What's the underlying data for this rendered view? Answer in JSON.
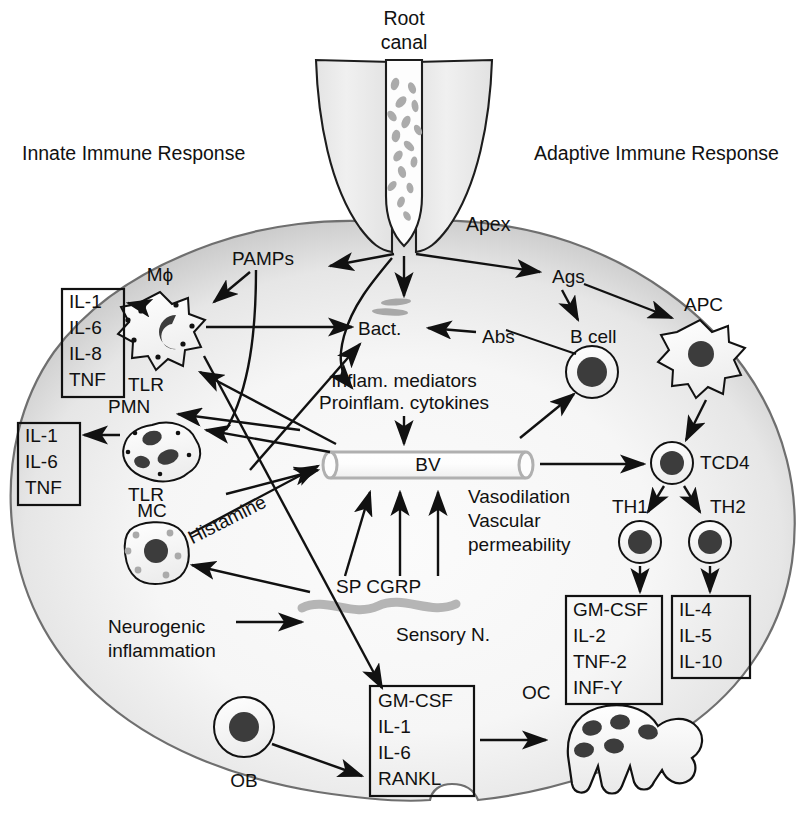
{
  "figure": {
    "headers": {
      "innate": "Innate Immune Response",
      "adaptive": "Adaptive Immune Response"
    },
    "anatomy": {
      "root_canal": "Root\ncanal",
      "root_canal_line1": "Root",
      "root_canal_line2": "canal",
      "apex": "Apex"
    },
    "nodes": {
      "pamps": "PAMPs",
      "mphi": "Mϕ",
      "tlr_mphi": "TLR",
      "pmn": "PMN",
      "tlr_pmn": "TLR",
      "mc": "MC",
      "histamine": "Histamine",
      "bact": "Bact.",
      "abs": "Abs",
      "ags": "Ags",
      "bcell": "B cell",
      "apc": "APC",
      "tcd4": "TCD4",
      "th1": "TH1",
      "th2": "TH2",
      "bv": "BV",
      "ob": "OB",
      "oc": "OC",
      "sp_cgrp": "SP CGRP",
      "sensory_n": "Sensory N.",
      "neurogenic_line1": "Neurogenic",
      "neurogenic_line2": "inflammation",
      "mediators_line1": "Inflam. mediators",
      "mediators_line2": "Proinflam. cytokines",
      "vaso_line1": "Vasodilation",
      "vaso_line2": "Vascular",
      "vaso_line3": "permeability"
    },
    "boxes": {
      "mphi_cytokines": {
        "name": "macrophage-cytokine-box",
        "items": [
          "IL-1",
          "IL-6",
          "IL-8",
          "TNF"
        ]
      },
      "pmn_cytokines": {
        "name": "pmn-cytokine-box",
        "items": [
          "IL-1",
          "IL-6",
          "TNF"
        ]
      },
      "th1_cytokines": {
        "name": "th1-cytokine-box",
        "items": [
          "GM-CSF",
          "IL-2",
          "TNF-2",
          "INF-Y"
        ]
      },
      "th2_cytokines": {
        "name": "th2-cytokine-box",
        "items": [
          "IL-4",
          "IL-5",
          "IL-10"
        ]
      },
      "osteo_factors": {
        "name": "osteoclastogenic-factor-box",
        "items": [
          "GM-CSF",
          "IL-1",
          "IL-6",
          "RANKL"
        ]
      }
    },
    "colors": {
      "ink": "#111111",
      "lesion_edge": "#8e8e8e",
      "lesion_fill": "#f2f2f2",
      "tooth_fill": "#ebebeb",
      "bacteria": "#a8a8a8",
      "nucleus": "#3a3a3a",
      "nerve": "#b3b3b3",
      "vessel": "#b0b0b0"
    }
  }
}
